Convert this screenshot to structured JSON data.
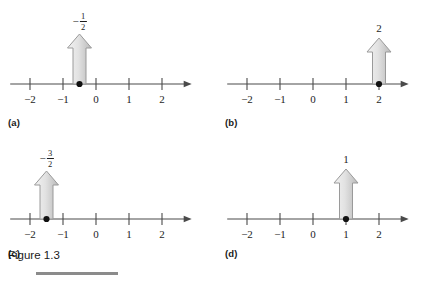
{
  "figure": {
    "caption": "Figure 1.3",
    "rule_color": "#8b8b8b",
    "background": "#ffffff"
  },
  "style": {
    "axis_color": "#4a4a4a",
    "tick_color": "#4a4a4a",
    "dot_color": "#111111",
    "arrow_fill_light": "#f2f2f2",
    "arrow_fill_dark": "#b9b9b9",
    "arrow_stroke": "#9a9a9a"
  },
  "panels": [
    {
      "tag": "(a)",
      "axis": {
        "ticks": [
          {
            "value": -2,
            "label": "−2"
          },
          {
            "value": -1,
            "label": "−1"
          },
          {
            "value": 0,
            "label": "0"
          },
          {
            "value": 1,
            "label": "1"
          },
          {
            "value": 2,
            "label": "2"
          }
        ],
        "min": -2.6,
        "max": 2.9
      },
      "point": {
        "value": -0.5,
        "label_type": "fraction",
        "label_sign": "−",
        "label_numerator": "1",
        "label_denominator": "2",
        "label_text": "−1/2"
      },
      "vector": {
        "magnitude": 0.5,
        "direction": "up",
        "height_px": 50
      }
    },
    {
      "tag": "(b)",
      "axis": {
        "ticks": [
          {
            "value": -2,
            "label": "−2"
          },
          {
            "value": -1,
            "label": "−1"
          },
          {
            "value": 0,
            "label": "0"
          },
          {
            "value": 1,
            "label": "1"
          },
          {
            "value": 2,
            "label": "2"
          }
        ],
        "min": -2.6,
        "max": 2.9
      },
      "point": {
        "value": 2,
        "label_type": "integer",
        "label_text": "2"
      },
      "vector": {
        "magnitude": 2,
        "direction": "up",
        "height_px": 46
      }
    },
    {
      "tag": "(c)",
      "axis": {
        "ticks": [
          {
            "value": -2,
            "label": "−2"
          },
          {
            "value": -1,
            "label": "−1"
          },
          {
            "value": 0,
            "label": "0"
          },
          {
            "value": 1,
            "label": "1"
          },
          {
            "value": 2,
            "label": "2"
          }
        ],
        "min": -2.6,
        "max": 2.9
      },
      "point": {
        "value": -1.5,
        "label_type": "fraction",
        "label_sign": "−",
        "label_numerator": "3",
        "label_denominator": "2",
        "label_text": "−3/2"
      },
      "vector": {
        "magnitude": 1.5,
        "direction": "up",
        "height_px": 48
      }
    },
    {
      "tag": "(d)",
      "axis": {
        "ticks": [
          {
            "value": -2,
            "label": "−2"
          },
          {
            "value": -1,
            "label": "−1"
          },
          {
            "value": 0,
            "label": "0"
          },
          {
            "value": 1,
            "label": "1"
          },
          {
            "value": 2,
            "label": "2"
          }
        ],
        "min": -2.6,
        "max": 2.9
      },
      "point": {
        "value": 1,
        "label_type": "integer",
        "label_text": "1"
      },
      "vector": {
        "magnitude": 1,
        "direction": "up",
        "height_px": 50
      }
    }
  ]
}
